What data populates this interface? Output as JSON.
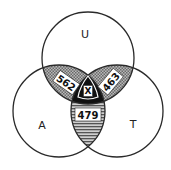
{
  "diagram": {
    "type": "venn-3",
    "sets": [
      {
        "id": "U",
        "label": "U"
      },
      {
        "id": "A",
        "label": "A"
      },
      {
        "id": "T",
        "label": "T"
      }
    ],
    "intersections": {
      "U_A": {
        "label": "562",
        "fill": "dotted-gray"
      },
      "U_T": {
        "label": "463",
        "fill": "dotted-gray"
      },
      "A_T": {
        "label": "479",
        "fill": "horizontal-hatch"
      },
      "U_A_T": {
        "label": "X",
        "fill": "black"
      }
    },
    "colors": {
      "stroke": "#2a2a2a",
      "pairwise_fill": "#8c8c8c",
      "center_fill": "#111111",
      "background": "#ffffff"
    }
  }
}
